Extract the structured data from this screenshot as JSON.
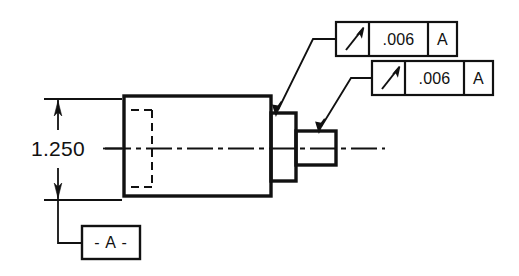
{
  "drawing": {
    "title": "Circular Runout Callout Detail",
    "background_color": "#ffffff",
    "line_color": "#111111",
    "part": {
      "name": "stepped-shaft-part",
      "description": "Stepped cylindrical part shown in section with hidden bore"
    },
    "dimension": {
      "name": "overall-diameter",
      "value": "1.250",
      "orientation": "vertical",
      "arrow_style": "outward"
    },
    "datum": {
      "label": "- A -",
      "letter": "A"
    },
    "feature_control_frames": [
      {
        "id": "fcf-upper",
        "symbol_name": "circular-runout-icon",
        "symbol_glyph": "arrow-slanted",
        "tolerance": ".006",
        "datum_reference": "A",
        "target": "large-shoulder-face"
      },
      {
        "id": "fcf-lower",
        "symbol_name": "circular-runout-icon",
        "symbol_glyph": "arrow-slanted",
        "tolerance": ".006",
        "datum_reference": "A",
        "target": "small-shaft-surface"
      }
    ],
    "centerline": {
      "name": "axis-centerline",
      "style": "dash-dot"
    },
    "hidden_feature": {
      "name": "hidden-bore",
      "style": "dashed"
    }
  }
}
